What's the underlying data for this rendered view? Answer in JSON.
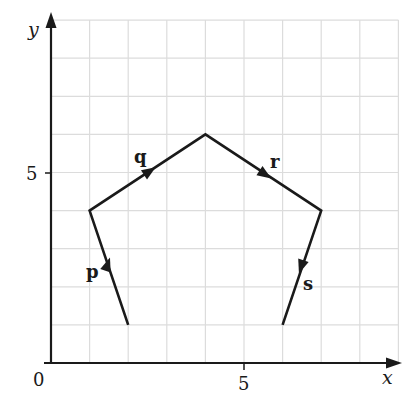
{
  "axes": {
    "x_label": "x",
    "y_label": "y",
    "origin_label": "0",
    "x_tick_label": "5",
    "y_tick_label": "5",
    "x_range": [
      0,
      9
    ],
    "y_range": [
      0,
      9
    ],
    "grid": true
  },
  "vectors": [
    {
      "name": "p",
      "from": [
        2,
        1
      ],
      "to": [
        1,
        4
      ]
    },
    {
      "name": "q",
      "from": [
        1,
        4
      ],
      "to": [
        4,
        6
      ]
    },
    {
      "name": "r",
      "from": [
        4,
        6
      ],
      "to": [
        7,
        4
      ]
    },
    {
      "name": "s",
      "from": [
        7,
        4
      ],
      "to": [
        6,
        1
      ]
    }
  ],
  "colors": {
    "grid": "#dcdcdc",
    "axis": "#1a1a1a",
    "vector": "#1a1a1a"
  }
}
